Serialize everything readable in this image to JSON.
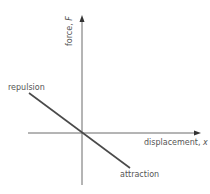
{
  "diagram": {
    "type": "force-displacement graph",
    "axes": {
      "x_label": "displacement, ",
      "x_var": "x",
      "y_label": "force, ",
      "y_var": "F"
    },
    "annotations": {
      "upper_left": "repulsion",
      "lower_right": "attraction"
    },
    "colors": {
      "axis": "#444444",
      "line": "#555555",
      "text": "#555555"
    }
  }
}
